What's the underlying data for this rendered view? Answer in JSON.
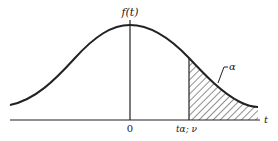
{
  "diagram": {
    "labels": {
      "y_axis": "f(t)",
      "origin": "0",
      "critical_value": "tα; ν",
      "x_axis": "t",
      "tail_area": "α"
    },
    "colors": {
      "line": "#222222",
      "background": "#ffffff",
      "hatch": "#333333"
    }
  }
}
